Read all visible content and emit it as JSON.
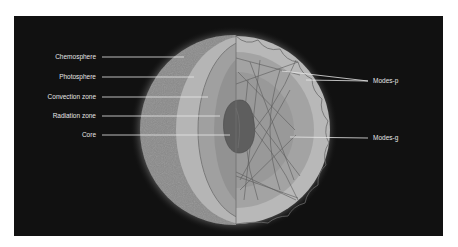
{
  "diagram": {
    "labels_left": [
      {
        "id": "chemosphere",
        "text": "Chemosphere",
        "y": 57
      },
      {
        "id": "photosphere",
        "text": "Photosphere",
        "y": 77
      },
      {
        "id": "convection-zone",
        "text": "Convection zone",
        "y": 97
      },
      {
        "id": "radiation-zone",
        "text": "Radiation zone",
        "y": 116
      },
      {
        "id": "core",
        "text": "Core",
        "y": 135
      }
    ],
    "labels_right": [
      {
        "id": "modes-p",
        "text": "Modes-p",
        "y": 81
      },
      {
        "id": "modes-g",
        "text": "Modes-g",
        "y": 138
      }
    ],
    "colors": {
      "background": "#111111",
      "outer_shell": "#8a8a8a",
      "photosphere_ring": "#b5b5b5",
      "convection_zone": "#a3a3a3",
      "radiation_zone": "#8f8f8f",
      "core": "#5e5e5e",
      "leader_line": "#e8e8e8",
      "label_text": "#e6e6e6"
    }
  }
}
